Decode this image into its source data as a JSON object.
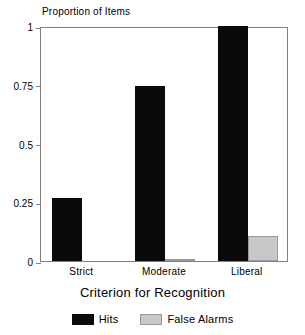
{
  "chart_data": {
    "type": "bar",
    "title": "",
    "xlabel": "Criterion for Recognition",
    "ylabel": "Proportion of Items",
    "categories": [
      "Strict",
      "Moderate",
      "Liberal"
    ],
    "series": [
      {
        "name": "Hits",
        "color": "#0a0a0a",
        "values": [
          0.27,
          0.745,
          1.0
        ]
      },
      {
        "name": "False Alarms",
        "color": "#c8c8c8",
        "values": [
          0.0,
          0.01,
          0.105
        ]
      }
    ],
    "ylim": [
      0,
      1
    ],
    "yticks": [
      "0",
      "0.25",
      "0.5",
      "0.75",
      "1"
    ],
    "ytick_values": [
      0,
      0.25,
      0.5,
      0.75,
      1
    ],
    "grid": false,
    "legend_position": "bottom"
  }
}
